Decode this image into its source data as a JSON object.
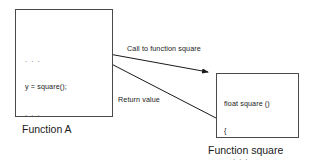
{
  "diagram": {
    "background_color": "#ffffff",
    "line_color": "#4a4a4a",
    "text_color": "#1a1a1a"
  },
  "boxes": {
    "function_a": {
      "caption": "Function A",
      "code_lines": [
        ". . .",
        "y = square();",
        ". . ."
      ]
    },
    "function_square": {
      "caption": "Function square",
      "code_lines": [
        "float square ()",
        "{",
        ". . .",
        "return val;",
        "}"
      ]
    }
  },
  "edges": {
    "call": {
      "label": "Call to function square",
      "direction": "function-a-to-function-square"
    },
    "return": {
      "label": "Return value",
      "direction": "function-square-to-function-a"
    }
  }
}
